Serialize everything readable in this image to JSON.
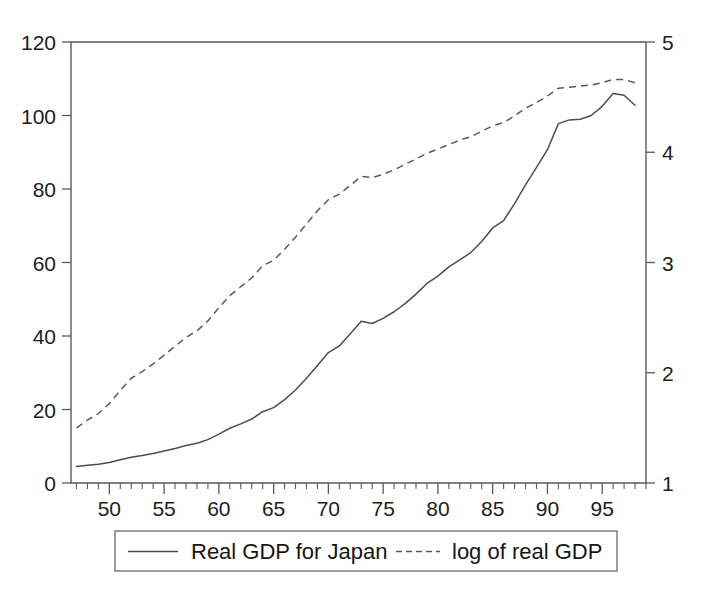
{
  "chart_data": {
    "type": "line",
    "title": "",
    "subtitle": "",
    "xlabel": "",
    "ylabel": "",
    "y2label": "",
    "grid": false,
    "legend_position": "bottom-center",
    "xlim": [
      1946.5,
      1999.0
    ],
    "ylim": [
      0,
      120
    ],
    "y2lim": [
      1,
      5
    ],
    "xticks_major": [
      1950,
      1955,
      1960,
      1965,
      1970,
      1975,
      1980,
      1985,
      1990,
      1995
    ],
    "xticklabels": [
      "50",
      "55",
      "60",
      "65",
      "70",
      "75",
      "80",
      "85",
      "90",
      "95"
    ],
    "xtick_minor_step": 1,
    "yticks_left": [
      0,
      20,
      40,
      60,
      80,
      100,
      120
    ],
    "yticklabels_left": [
      "0",
      "20",
      "40",
      "60",
      "80",
      "100",
      "120"
    ],
    "yticks_right": [
      1,
      2,
      3,
      4,
      5
    ],
    "yticklabels_right": [
      "1",
      "2",
      "3",
      "4",
      "5"
    ],
    "x": [
      1947,
      1948,
      1949,
      1950,
      1951,
      1952,
      1953,
      1954,
      1955,
      1956,
      1957,
      1958,
      1959,
      1960,
      1961,
      1962,
      1963,
      1964,
      1965,
      1966,
      1967,
      1968,
      1969,
      1970,
      1971,
      1972,
      1973,
      1974,
      1975,
      1976,
      1977,
      1978,
      1979,
      1980,
      1981,
      1982,
      1983,
      1984,
      1985,
      1986,
      1987,
      1988,
      1989,
      1990,
      1991,
      1992,
      1993,
      1994,
      1995,
      1996,
      1997,
      1998
    ],
    "series": [
      {
        "name": "Real GDP for Japan",
        "axis": "left",
        "style": "solid",
        "color": "#4d4d4d",
        "values": [
          4.5,
          4.8,
          5.1,
          5.6,
          6.3,
          7.0,
          7.5,
          8.0,
          8.7,
          9.4,
          10.2,
          10.8,
          11.8,
          13.3,
          14.9,
          16.1,
          17.4,
          19.4,
          20.5,
          22.7,
          25.3,
          28.5,
          32.0,
          35.5,
          37.3,
          40.6,
          44.0,
          43.4,
          44.8,
          46.6,
          48.8,
          51.4,
          54.3,
          56.3,
          58.8,
          60.7,
          62.7,
          65.7,
          69.4,
          71.4,
          76.0,
          81.1,
          85.9,
          90.7,
          97.8,
          98.8,
          99.0,
          100.0,
          102.5,
          106.0,
          105.5,
          102.8
        ]
      },
      {
        "name": "log of real GDP",
        "axis": "right",
        "style": "dashed",
        "color": "#5a5a5a",
        "values": [
          1.5,
          1.57,
          1.63,
          1.72,
          1.84,
          1.95,
          2.01,
          2.08,
          2.16,
          2.24,
          2.32,
          2.38,
          2.47,
          2.59,
          2.7,
          2.78,
          2.86,
          2.97,
          3.02,
          3.12,
          3.23,
          3.35,
          3.47,
          3.57,
          3.62,
          3.7,
          3.78,
          3.77,
          3.8,
          3.84,
          3.89,
          3.94,
          3.99,
          4.03,
          4.07,
          4.11,
          4.14,
          4.19,
          4.24,
          4.27,
          4.33,
          4.4,
          4.45,
          4.51,
          4.58,
          4.59,
          4.6,
          4.61,
          4.63,
          4.66,
          4.66,
          4.63
        ]
      }
    ],
    "annotations": []
  },
  "legend": {
    "items": [
      {
        "label": "Real GDP for Japan",
        "style": "solid"
      },
      {
        "label": "log of real GDP",
        "style": "dashed"
      }
    ]
  }
}
